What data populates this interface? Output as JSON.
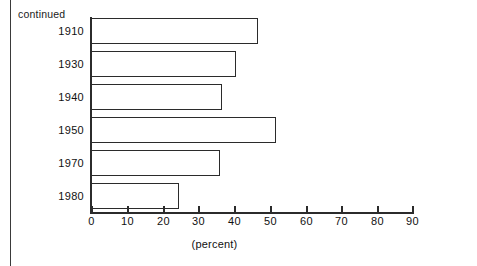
{
  "page": {
    "continued_note": "continued"
  },
  "chart_data": {
    "type": "bar",
    "orientation": "horizontal",
    "title": "",
    "subtitle": "",
    "xlabel": "(percent)",
    "ylabel": "",
    "categories": [
      "1910",
      "1930",
      "1940",
      "1950",
      "1970",
      "1980"
    ],
    "values": [
      46.5,
      40.5,
      36.5,
      51.5,
      36.0,
      24.5
    ],
    "series": [
      {
        "name": "percent",
        "values": [
          46.5,
          40.5,
          36.5,
          51.5,
          36.0,
          24.5
        ]
      }
    ],
    "xlim": [
      0,
      90
    ],
    "ylim": null,
    "xticks": [
      0,
      10,
      20,
      30,
      40,
      50,
      60,
      70,
      80,
      90
    ],
    "xtick_labels": [
      "0",
      "10",
      "20",
      "30",
      "40",
      "50",
      "60",
      "70",
      "80",
      "90"
    ],
    "grid": false,
    "legend": false,
    "legend_position": "none",
    "bar_style": {
      "fill": "#ffffff",
      "stroke": "#2b2b2b"
    },
    "annotations": [
      "continued"
    ]
  }
}
